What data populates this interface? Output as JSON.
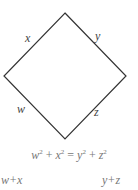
{
  "diagram": {
    "shape": "square rotated 45 degrees (diamond)",
    "vertices": {
      "top": [
        65,
        13
      ],
      "right": [
        126,
        76
      ],
      "bottom": [
        65,
        139
      ],
      "left": [
        4,
        76
      ]
    },
    "stroke_color": "#333333",
    "edge_labels": {
      "top_left": "x",
      "top_right": "y",
      "bottom_left": "w",
      "bottom_right": "z"
    },
    "equation": {
      "lhs": [
        {
          "var": "w",
          "exp": "2"
        },
        {
          "op": "+"
        },
        {
          "var": "x",
          "exp": "2"
        }
      ],
      "eq": "=",
      "rhs": [
        {
          "var": "y",
          "exp": "2"
        },
        {
          "op": "+"
        },
        {
          "var": "z",
          "exp": "2"
        }
      ]
    },
    "bottom_left_expr": "w+x",
    "bottom_right_expr": "y+z"
  }
}
